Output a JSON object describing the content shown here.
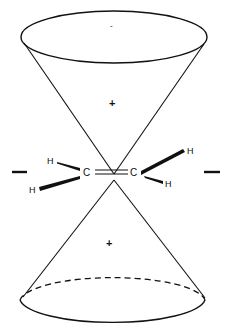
{
  "diagram": {
    "colors": {
      "stroke": "#111111",
      "background": "#ffffff"
    },
    "upper_cone": {
      "sign_label": "+",
      "apex_tick": "-"
    },
    "lower_cone": {
      "sign_label": "+"
    },
    "molecule": {
      "carbon_left": "C",
      "carbon_right": "C",
      "hydrogens": [
        "H",
        "H",
        "H",
        "H"
      ],
      "bond": "double"
    },
    "side_markers": {
      "left": "—",
      "right": "—"
    }
  }
}
